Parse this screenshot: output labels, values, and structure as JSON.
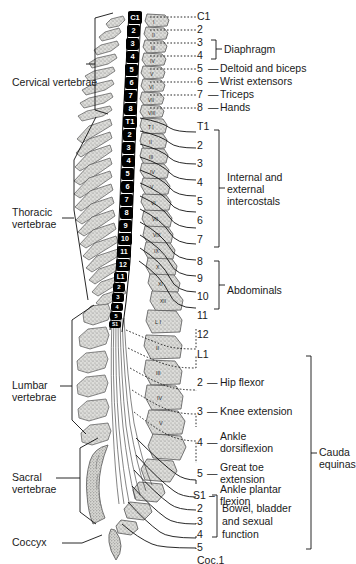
{
  "figure": {
    "colors": {
      "ink": "#1a1a1a",
      "bone_fill": "#d8d8d4",
      "bone_stroke": "#555555",
      "cord_fill": "#000000",
      "cord_text": "#ffffff",
      "background": "#ffffff"
    }
  },
  "left_labels": [
    {
      "text": "Cervical vertebrae",
      "region": "cervical"
    },
    {
      "text": "Thoracic",
      "region": "thoracic"
    },
    {
      "text": "vertebrae",
      "region": "thoracic"
    },
    {
      "text": "Lumbar",
      "region": "lumbar"
    },
    {
      "text": "vertebrae",
      "region": "lumbar"
    },
    {
      "text": "Sacral",
      "region": "sacral"
    },
    {
      "text": "vertebrae",
      "region": "sacral"
    },
    {
      "text": "Coccyx",
      "region": "coccyx"
    }
  ],
  "cord_segments": [
    {
      "label": "C1"
    },
    {
      "label": "2"
    },
    {
      "label": "3"
    },
    {
      "label": "4"
    },
    {
      "label": "5"
    },
    {
      "label": "6"
    },
    {
      "label": "7"
    },
    {
      "label": "8"
    },
    {
      "label": "T1"
    },
    {
      "label": "2"
    },
    {
      "label": "3"
    },
    {
      "label": "4"
    },
    {
      "label": "5"
    },
    {
      "label": "6"
    },
    {
      "label": "7"
    },
    {
      "label": "8"
    },
    {
      "label": "9"
    },
    {
      "label": "10"
    },
    {
      "label": "11"
    },
    {
      "label": "12"
    },
    {
      "label": "L1"
    },
    {
      "label": "2"
    },
    {
      "label": "3"
    },
    {
      "label": "4"
    },
    {
      "label": "5"
    },
    {
      "label": "S1"
    },
    {
      "label": "2"
    },
    {
      "label": "3"
    },
    {
      "label": "4"
    },
    {
      "label": "5"
    }
  ],
  "vertebrae_numerals": [
    "I",
    "II",
    "III",
    "IV",
    "V",
    "VI",
    "VII",
    "VIII",
    "T I",
    "II",
    "III",
    "IV",
    "V",
    "VI",
    "VII",
    "VIII",
    "IX",
    "X",
    "XI",
    "XII",
    "L I",
    "II",
    "III",
    "IV",
    "V"
  ],
  "nerve_rows": [
    {
      "num": "C1",
      "function": ""
    },
    {
      "num": "2",
      "function": ""
    },
    {
      "num": "3",
      "function": ""
    },
    {
      "num": "4",
      "function": ""
    },
    {
      "num": "5",
      "function": "Deltoid and biceps"
    },
    {
      "num": "6",
      "function": "Wrist extensors"
    },
    {
      "num": "7",
      "function": "Triceps"
    },
    {
      "num": "8",
      "function": "Hands"
    },
    {
      "num": "T1",
      "function": ""
    },
    {
      "num": "2",
      "function": ""
    },
    {
      "num": "3",
      "function": ""
    },
    {
      "num": "4",
      "function": ""
    },
    {
      "num": "5",
      "function": ""
    },
    {
      "num": "6",
      "function": ""
    },
    {
      "num": "7",
      "function": ""
    },
    {
      "num": "8",
      "function": ""
    },
    {
      "num": "9",
      "function": ""
    },
    {
      "num": "10",
      "function": ""
    },
    {
      "num": "11",
      "function": ""
    },
    {
      "num": "12",
      "function": ""
    },
    {
      "num": "L1",
      "function": ""
    },
    {
      "num": "2",
      "function": "Hip flexor"
    },
    {
      "num": "3",
      "function": "Knee extension"
    },
    {
      "num": "4",
      "function": "Ankle\ndorsiflexion"
    },
    {
      "num": "5",
      "function": "Great toe\nextension"
    },
    {
      "num": "S1",
      "function": "Ankle plantar\nflexion"
    },
    {
      "num": "2",
      "function": ""
    },
    {
      "num": "3",
      "function": ""
    },
    {
      "num": "4",
      "function": ""
    },
    {
      "num": "5",
      "function": ""
    },
    {
      "num": "Coc.1",
      "function": ""
    }
  ],
  "bracket_groups": [
    {
      "label": "Diaphragm",
      "covers": "3-4"
    },
    {
      "label": "Internal and\nexternal\nintercostals",
      "covers": "T2-T7"
    },
    {
      "label": "Abdominals",
      "covers": "T8-T12"
    },
    {
      "label": "Bowel, bladder\nand sexual\nfunction",
      "covers": "S2-S5"
    },
    {
      "label": "Cauda\nequinas",
      "covers": "L2-Coc.1"
    }
  ],
  "group_label_text": {
    "diaphragm": "Diaphragm",
    "intercostals_1": "Internal and",
    "intercostals_2": "external",
    "intercostals_3": "intercostals",
    "abdominals": "Abdominals",
    "bowel_1": "Bowel, bladder",
    "bowel_2": "and sexual",
    "bowel_3": "function",
    "cauda_1": "Cauda",
    "cauda_2": "equinas",
    "ankle_1": "Ankle",
    "ankle_2": "dorsiflexion",
    "greattoe_1": "Great toe",
    "greattoe_2": "extension",
    "plantar_1": "Ankle plantar",
    "plantar_2": "flexion",
    "deltoid": "Deltoid and biceps",
    "wrist": "Wrist extensors",
    "triceps": "Triceps",
    "hands": "Hands",
    "hip": "Hip flexor",
    "knee": "Knee extension"
  },
  "num_column": {
    "c1": "C1",
    "c2": "2",
    "c3": "3",
    "c4": "4",
    "c5": "5",
    "c6": "6",
    "c7": "7",
    "c8": "8",
    "t1": "T1",
    "t2": "2",
    "t3": "3",
    "t4": "4",
    "t5": "5",
    "t6": "6",
    "t7": "7",
    "t8": "8",
    "t9": "9",
    "t10": "10",
    "t11": "11",
    "t12": "12",
    "l1": "L1",
    "l2": "2",
    "l3": "3",
    "l4": "4",
    "l5": "5",
    "s1": "S1",
    "s2": "2",
    "s3": "3",
    "s4": "4",
    "s5": "5",
    "coc1": "Coc.1"
  },
  "dashes": {
    "deltoid": "—",
    "wrist": "—",
    "triceps": "—",
    "hands": "—",
    "hip": "—",
    "knee": "—",
    "ankle": "—",
    "greattoe": "—",
    "plantar": "–"
  }
}
